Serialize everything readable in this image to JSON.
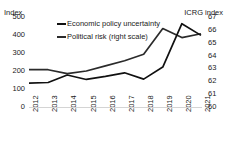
{
  "chart_data": {
    "type": "line",
    "title": "",
    "xlabel": "",
    "ylabel": "Index",
    "y2label": "ICRG index",
    "grid": false,
    "legend_position": "top-left",
    "x": [
      "2012",
      "2013",
      "2014",
      "2015",
      "2016",
      "2017",
      "2018",
      "2019",
      "2020",
      "2021"
    ],
    "categories": [
      "2012",
      "2013",
      "2014",
      "2015",
      "2016",
      "2017",
      "2018",
      "2019",
      "2020",
      "2021"
    ],
    "ylim": [
      0,
      500
    ],
    "y2lim": [
      60,
      67
    ],
    "yticks": [
      "500",
      "400",
      "300",
      "200",
      "100",
      "0"
    ],
    "y2ticks": [
      "67",
      "66",
      "65",
      "64",
      "63",
      "62",
      "61",
      "60"
    ],
    "series": [
      {
        "name": "Economic policy uncertainty",
        "axis": "left",
        "color": "#111111",
        "values": [
          133,
          136,
          178,
          153,
          170,
          190,
          155,
          222,
          463,
          398
        ]
      },
      {
        "name": "Political risk (right scale)",
        "axis": "right",
        "color": "#2b2b2b",
        "values": [
          62.9,
          62.9,
          62.6,
          62.8,
          63.2,
          63.6,
          64.1,
          66.1,
          65.4,
          65.7
        ]
      }
    ]
  },
  "axis": {
    "left_title": "Index",
    "right_title": "ICRG index"
  },
  "legend": {
    "items": [
      {
        "label": "Economic policy uncertainty"
      },
      {
        "label": "Political risk (right scale)"
      }
    ]
  }
}
